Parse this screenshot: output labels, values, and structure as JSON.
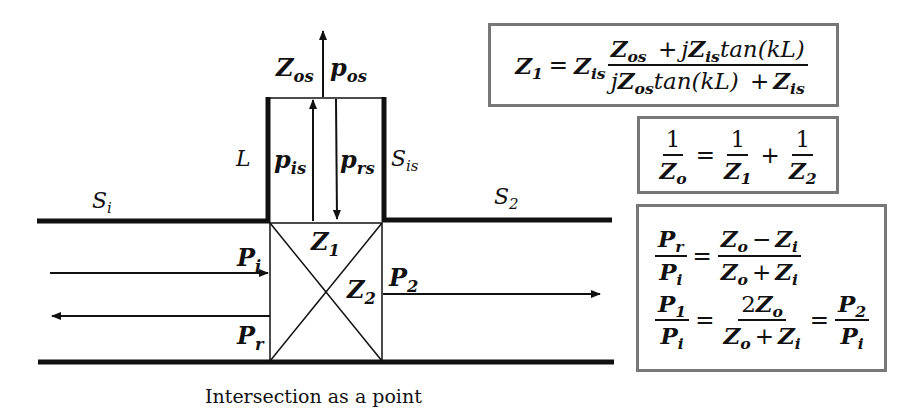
{
  "diagram": {
    "caption": "Intersection as a point",
    "labels": {
      "Z_os": {
        "base": "Z",
        "sub": "os"
      },
      "p_os": {
        "base": "p",
        "sub": "os"
      },
      "L": "L",
      "p_is": {
        "base": "p",
        "sub": "is"
      },
      "p_rs": {
        "base": "p",
        "sub": "rs"
      },
      "S_is": {
        "base": "S",
        "sub": "is"
      },
      "S_i": {
        "base": "S",
        "sub": "i"
      },
      "S_2": {
        "base": "S",
        "sub": "2"
      },
      "Z_1": {
        "base": "Z",
        "sub": "1"
      },
      "Z_2": {
        "base": "Z",
        "sub": "2"
      },
      "P_i": {
        "base": "P",
        "sub": "i"
      },
      "P_r": {
        "base": "P",
        "sub": "r"
      },
      "P_2": {
        "base": "P",
        "sub": "2"
      }
    },
    "colors": {
      "line": "#111111",
      "box_border": "#777777",
      "background": "#ffffff"
    }
  },
  "formulas": {
    "z1": {
      "lhs": {
        "base": "Z",
        "sub": "1"
      },
      "eq": "=",
      "factor": {
        "base": "Z",
        "sub": "is"
      },
      "num": {
        "t1": {
          "base": "Z",
          "sub": "os"
        },
        "plus": "+",
        "j": "j",
        "t2": {
          "base": "Z",
          "sub": "is"
        },
        "tan": "tan(kL)"
      },
      "den": {
        "j": "j",
        "t1": {
          "base": "Z",
          "sub": "os"
        },
        "tan": "tan(kL)",
        "plus": "+",
        "t2": {
          "base": "Z",
          "sub": "is"
        }
      }
    },
    "parallel": {
      "one": "1",
      "eq": "=",
      "plus": "+",
      "zo": {
        "base": "Z",
        "sub": "o"
      },
      "z1": {
        "base": "Z",
        "sub": "1"
      },
      "z2": {
        "base": "Z",
        "sub": "2"
      }
    },
    "ratios": {
      "r1": {
        "num": {
          "base": "P",
          "sub": "r"
        },
        "den": {
          "base": "P",
          "sub": "i"
        },
        "eq": "=",
        "rnum": {
          "a": {
            "base": "Z",
            "sub": "o"
          },
          "op": "−",
          "b": {
            "base": "Z",
            "sub": "i"
          }
        },
        "rden": {
          "a": {
            "base": "Z",
            "sub": "o"
          },
          "op": "+",
          "b": {
            "base": "Z",
            "sub": "i"
          }
        }
      },
      "r2": {
        "num": {
          "base": "P",
          "sub": "1"
        },
        "den": {
          "base": "P",
          "sub": "i"
        },
        "eq": "=",
        "rnum": {
          "coef": "2",
          "a": {
            "base": "Z",
            "sub": "o"
          }
        },
        "rden": {
          "a": {
            "base": "Z",
            "sub": "o"
          },
          "op": "+",
          "b": {
            "base": "Z",
            "sub": "i"
          }
        },
        "eq2": "=",
        "num2": {
          "base": "P",
          "sub": "2"
        },
        "den2": {
          "base": "P",
          "sub": "i"
        }
      }
    }
  }
}
